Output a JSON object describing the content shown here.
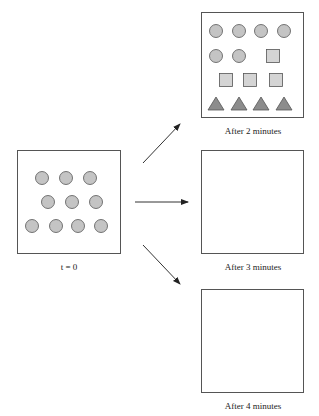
{
  "diagram": {
    "initial": {
      "label": "t = 0",
      "shapes": [
        {
          "type": "circle",
          "cx": 42,
          "cy": 178
        },
        {
          "type": "circle",
          "cx": 66,
          "cy": 178
        },
        {
          "type": "circle",
          "cx": 90,
          "cy": 178
        },
        {
          "type": "circle",
          "cx": 48,
          "cy": 202
        },
        {
          "type": "circle",
          "cx": 72,
          "cy": 202
        },
        {
          "type": "circle",
          "cx": 96,
          "cy": 202
        },
        {
          "type": "circle",
          "cx": 32,
          "cy": 226
        },
        {
          "type": "circle",
          "cx": 56,
          "cy": 226
        },
        {
          "type": "circle",
          "cx": 78,
          "cy": 226
        },
        {
          "type": "circle",
          "cx": 101,
          "cy": 226
        }
      ]
    },
    "panels": [
      {
        "label": "After 2 minutes",
        "shapes": [
          {
            "type": "circle",
            "cx": 216,
            "cy": 31
          },
          {
            "type": "circle",
            "cx": 239,
            "cy": 31
          },
          {
            "type": "circle",
            "cx": 261,
            "cy": 31
          },
          {
            "type": "circle",
            "cx": 284,
            "cy": 31
          },
          {
            "type": "circle",
            "cx": 216,
            "cy": 56
          },
          {
            "type": "circle",
            "cx": 239,
            "cy": 56
          },
          {
            "type": "square",
            "cx": 273,
            "cy": 56
          },
          {
            "type": "square",
            "cx": 226,
            "cy": 80
          },
          {
            "type": "square",
            "cx": 250,
            "cy": 80
          },
          {
            "type": "square",
            "cx": 276,
            "cy": 80
          },
          {
            "type": "triangle",
            "cx": 216,
            "cy": 104
          },
          {
            "type": "triangle",
            "cx": 239,
            "cy": 104
          },
          {
            "type": "triangle",
            "cx": 261,
            "cy": 104
          },
          {
            "type": "triangle",
            "cx": 284,
            "cy": 104
          }
        ]
      },
      {
        "label": "After 3 minutes",
        "shapes": []
      },
      {
        "label": "After 4 minutes",
        "shapes": []
      }
    ],
    "colors": {
      "circle_fill": "#c4c4c4",
      "square_fill": "#d4d4d4",
      "triangle_fill": "#8c8c8c",
      "stroke": "#555555"
    }
  }
}
